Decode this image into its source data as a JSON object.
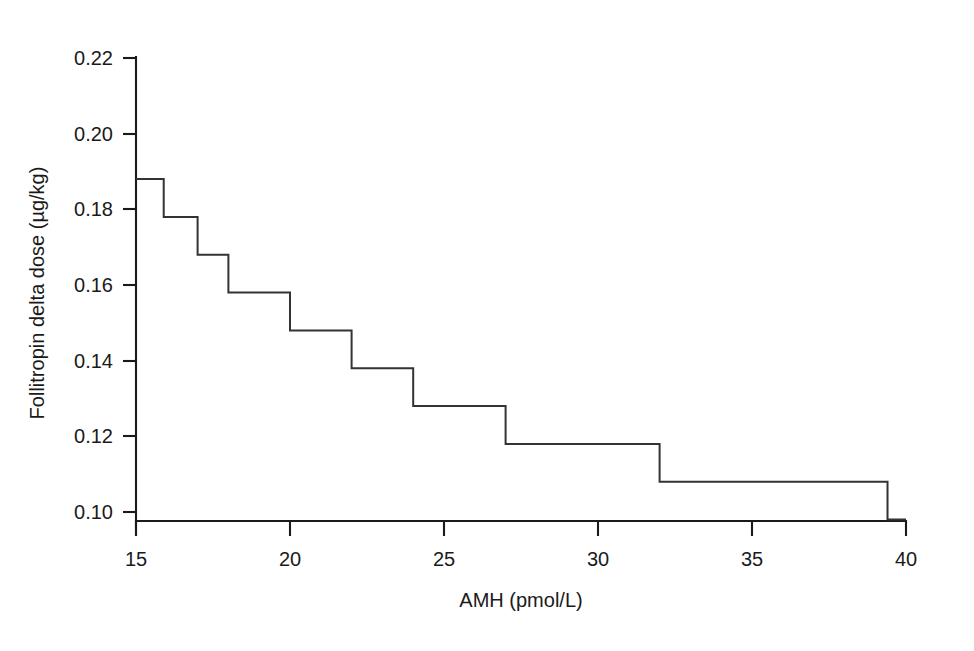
{
  "chart_data": {
    "type": "line",
    "subtype": "step",
    "title": "",
    "xlabel": "AMH (pmol/L)",
    "ylabel": "Follitropin delta dose (µg/kg)",
    "xlim": [
      15,
      40
    ],
    "ylim": [
      0.095,
      0.222
    ],
    "xticks": [
      15,
      20,
      25,
      30,
      35,
      40
    ],
    "xtick_labels": [
      "15",
      "20",
      "25",
      "30",
      "35",
      "40"
    ],
    "yticks": [
      0.1,
      0.12,
      0.14,
      0.16,
      0.18,
      0.2,
      0.22
    ],
    "ytick_labels": [
      "0.10",
      "0.12",
      "0.14",
      "0.16",
      "0.18",
      "0.20",
      "0.22"
    ],
    "grid": false,
    "legend": false,
    "line_color": "#333333",
    "step_mode": "post",
    "x": [
      15.0,
      15.9,
      17.0,
      18.0,
      20.0,
      22.0,
      24.0,
      27.0,
      32.0,
      39.4,
      40.0
    ],
    "y": [
      0.188,
      0.178,
      0.168,
      0.158,
      0.148,
      0.138,
      0.128,
      0.118,
      0.108,
      0.098,
      0.098
    ],
    "series": [
      {
        "name": "Follitropin delta dose",
        "x": [
          15.0,
          15.9,
          17.0,
          18.0,
          20.0,
          22.0,
          24.0,
          27.0,
          32.0,
          39.4,
          40.0
        ],
        "values": [
          0.188,
          0.178,
          0.168,
          0.158,
          0.148,
          0.138,
          0.128,
          0.118,
          0.108,
          0.098,
          0.098
        ]
      }
    ],
    "annotations": []
  },
  "axes": {
    "x_title": "AMH (pmol/L)",
    "y_title": "Follitropin delta dose (µg/kg)"
  }
}
